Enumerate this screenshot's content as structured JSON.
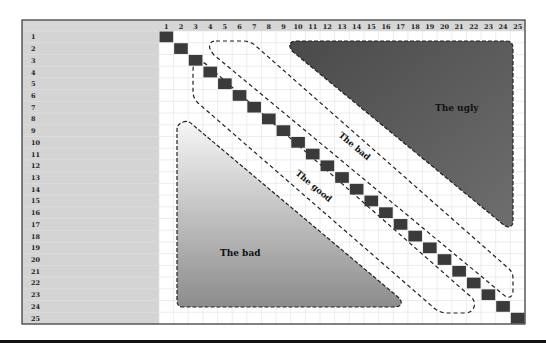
{
  "matrix": {
    "size": 25,
    "column_headers": [
      "1",
      "2",
      "3",
      "4",
      "5",
      "6",
      "7",
      "8",
      "9",
      "10",
      "11",
      "12",
      "13",
      "14",
      "15",
      "16",
      "17",
      "18",
      "19",
      "20",
      "21",
      "22",
      "23",
      "24",
      "25"
    ],
    "row_headers": [
      "1",
      "2",
      "3",
      "4",
      "5",
      "6",
      "7",
      "8",
      "9",
      "10",
      "11",
      "12",
      "13",
      "14",
      "15",
      "16",
      "17",
      "18",
      "19",
      "20",
      "21",
      "22",
      "23",
      "24",
      "25"
    ],
    "diagonal_cells": "all 25 diagonal cells filled dark"
  },
  "regions": {
    "ugly": {
      "label": "The ugly",
      "fill": "#5a5a5a"
    },
    "bad_upper": {
      "label": "The bad"
    },
    "good": {
      "label": "The good"
    },
    "bad_lower": {
      "label": "The bad",
      "fill_top": "#f4f4f4",
      "fill_bottom": "#8f8f8f"
    }
  },
  "colors": {
    "header_bg": "#d6d6d6",
    "left_panel_bg": "#d4d4d4",
    "grid_line": "#dcdcdc",
    "diag_cell": "#3a3a3a",
    "border": "#333333"
  }
}
